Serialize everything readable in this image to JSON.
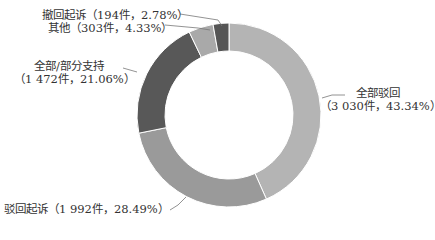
{
  "chart_data": {
    "type": "pie",
    "donut": true,
    "title": "",
    "categories": [
      "全部驳回",
      "驳回起诉",
      "全部/部分支持",
      "其他",
      "撤回起诉"
    ],
    "values": [
      3030,
      1992,
      1472,
      303,
      194
    ],
    "percentages": [
      43.34,
      28.49,
      21.06,
      4.33,
      2.78
    ],
    "colors": [
      "#b4b4b4",
      "#9a9a9a",
      "#585858",
      "#a9a9a9",
      "#555555"
    ],
    "unit": "件",
    "labels": {
      "all_reject": {
        "name": "全部驳回",
        "detail": "（3 030件，43.34%）"
      },
      "dismiss": {
        "text": "驳回起诉（1 992件，28.49%）"
      },
      "support": {
        "name": "全部/部分支持",
        "detail": "（1 472件，21.06%）"
      },
      "other": {
        "text": "其他（303件，4.33%）"
      },
      "withdraw": {
        "text": "撤回起诉（194件，2.78%）"
      }
    },
    "legend": "none (leader-line labels)"
  }
}
